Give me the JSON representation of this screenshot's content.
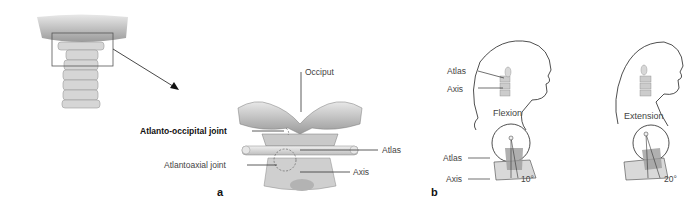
{
  "figure": {
    "panels": [
      {
        "id": "a",
        "letter": "a",
        "labels": {
          "occiput": "Occiput",
          "atlanto_occipital_joint": "Atlanto-occipital joint",
          "atlas": "Atlas",
          "atlantoaxial_joint": "Atlantoaxial joint",
          "axis": "Axis"
        }
      },
      {
        "id": "b",
        "letter": "b",
        "flexion": {
          "title": "Flexion",
          "head_labels": {
            "atlas": "Atlas",
            "axis": "Axis"
          },
          "detail_labels": {
            "atlas": "Atlas",
            "axis": "Axis"
          },
          "angle": "10°"
        },
        "extension": {
          "title": "Extension",
          "angle": "20°"
        }
      }
    ]
  },
  "colors": {
    "background": "#ffffff",
    "bone_light": "#e4e4e4",
    "bone_mid": "#b8b8b8",
    "bone_dark": "#7a7a7a",
    "line": "#333333",
    "label_text": "#444444"
  }
}
